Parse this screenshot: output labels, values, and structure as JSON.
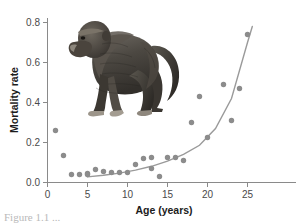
{
  "figure": {
    "illustration_name": "baboon-illustration",
    "caption_partial": "Figure 1.1 ...",
    "colors": {
      "point": "#8c8c8c",
      "curve": "#9a9a9a",
      "axis": "#8a8a8a",
      "text": "#1c1c1c",
      "background": "#ffffff"
    }
  },
  "chart_data": {
    "type": "scatter",
    "title": "",
    "xlabel": "Age (years)",
    "ylabel": "Mortality rate",
    "xlim": [
      0,
      27
    ],
    "ylim": [
      0.0,
      0.88
    ],
    "xticks": [
      0,
      5,
      10,
      15,
      20,
      25
    ],
    "xtick_labels": [
      "0",
      "5",
      "10",
      "15",
      "20",
      "25"
    ],
    "yticks": [
      0.0,
      0.2,
      0.4,
      0.6,
      0.8
    ],
    "ytick_labels": [
      "0.0",
      "0.2",
      "0.4",
      "0.6",
      "0.8"
    ],
    "grid": false,
    "legend": null,
    "x": [
      1,
      2,
      3,
      4,
      5,
      5,
      6,
      7,
      8,
      9,
      10,
      11,
      12,
      13,
      13,
      14,
      15,
      16,
      17,
      18,
      19,
      20,
      22,
      23,
      24,
      25
    ],
    "y": [
      0.26,
      0.135,
      0.04,
      0.04,
      0.045,
      0.04,
      0.065,
      0.055,
      0.05,
      0.05,
      0.05,
      0.09,
      0.12,
      0.07,
      0.125,
      0.03,
      0.125,
      0.125,
      0.11,
      0.3,
      0.43,
      0.225,
      0.49,
      0.31,
      0.47,
      0.74
    ],
    "series": [
      {
        "name": "observed mortality rate",
        "marker": "circle",
        "color": "#8c8c8c",
        "values": [
          0.26,
          0.135,
          0.04,
          0.04,
          0.045,
          0.04,
          0.065,
          0.055,
          0.05,
          0.05,
          0.05,
          0.09,
          0.12,
          0.07,
          0.125,
          0.03,
          0.125,
          0.125,
          0.11,
          0.3,
          0.43,
          0.225,
          0.49,
          0.31,
          0.47,
          0.74
        ]
      },
      {
        "name": "fitted exponential curve",
        "marker": "line",
        "color": "#9a9a9a",
        "x": [
          5,
          7,
          9,
          11,
          13,
          15,
          17,
          19,
          21,
          23,
          25,
          25.6
        ],
        "values": [
          0.028,
          0.036,
          0.047,
          0.062,
          0.081,
          0.107,
          0.141,
          0.186,
          0.27,
          0.42,
          0.7,
          0.78
        ]
      }
    ]
  }
}
